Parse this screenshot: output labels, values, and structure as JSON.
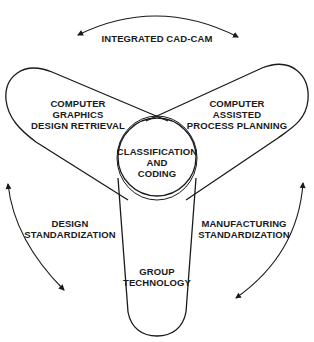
{
  "diagram": {
    "center": {
      "label": "CLASSIFICATION\nAND\nCODING"
    },
    "lobes": [
      {
        "id": "left",
        "label": "COMPUTER\nGRAPHICS\nDESIGN RETRIEVAL"
      },
      {
        "id": "right",
        "label": "COMPUTER\nASSISTED\nPROCESS PLANNING"
      },
      {
        "id": "bottom",
        "label": "GROUP\nTECHNOLOGY"
      }
    ],
    "arrows": [
      {
        "id": "top",
        "label": "INTEGRATED CAD-CAM",
        "direction": "bidirectional"
      },
      {
        "id": "left",
        "label": "DESIGN\nSTANDARDIZATION",
        "direction": "bidirectional"
      },
      {
        "id": "right",
        "label": "MANUFACTURING\nSTANDARDIZATION",
        "direction": "bidirectional"
      }
    ],
    "colors": {
      "stroke": "#1a1a1a",
      "background": "#ffffff"
    }
  }
}
